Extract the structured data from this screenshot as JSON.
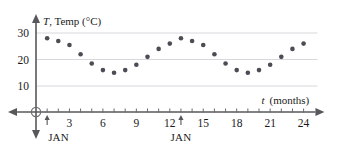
{
  "chart_data": {
    "type": "scatter",
    "title": "",
    "ylabel": "T, Temp (°C)",
    "ylabel_var": "T",
    "ylabel_rest": ", Temp (°C)",
    "xlabel": "t (months)",
    "xlabel_var": "t",
    "xlabel_rest": "(months)",
    "xlim": [
      0,
      25.6
    ],
    "ylim": [
      0,
      32
    ],
    "grid": true,
    "gridlines_y": [
      10,
      20,
      30
    ],
    "yticks": [
      10,
      20,
      30
    ],
    "ytick_labels": [
      "10",
      "20",
      "30"
    ],
    "xticks": [
      1,
      2,
      3,
      4,
      5,
      6,
      7,
      8,
      9,
      10,
      11,
      12,
      13,
      14,
      15,
      16,
      17,
      18,
      19,
      20,
      21,
      22,
      23,
      24
    ],
    "xtick_labels_shown": [
      {
        "t": 3,
        "label": "3"
      },
      {
        "t": 6,
        "label": "6"
      },
      {
        "t": 9,
        "label": "9"
      },
      {
        "t": 12,
        "label": "12"
      },
      {
        "t": 15,
        "label": "15"
      },
      {
        "t": 18,
        "label": "18"
      },
      {
        "t": 21,
        "label": "21"
      },
      {
        "t": 24,
        "label": "24"
      }
    ],
    "annotations": [
      {
        "name": "jan-marker-year1",
        "t": 1,
        "label": "JAN"
      },
      {
        "name": "jan-marker-year2",
        "t": 13,
        "label": "JAN"
      }
    ],
    "origin_marker": true,
    "legend": null,
    "x": [
      1,
      2,
      3,
      4,
      5,
      6,
      7,
      8,
      9,
      10,
      11,
      12,
      13,
      14,
      15,
      16,
      17,
      18,
      19,
      20,
      21,
      22,
      23,
      24
    ],
    "values": [
      28,
      27,
      25.5,
      22,
      18.5,
      16,
      15,
      16,
      18,
      21,
      24,
      26,
      28,
      27,
      25.5,
      22,
      18.5,
      16,
      15,
      16,
      18,
      21,
      24,
      26
    ],
    "series": [
      {
        "name": "Monthly average temperature",
        "values": [
          28,
          27,
          25.5,
          22,
          18.5,
          16,
          15,
          16,
          18,
          21,
          24,
          26,
          28,
          27,
          25.5,
          22,
          18.5,
          16,
          15,
          16,
          18,
          21,
          24,
          26
        ]
      }
    ]
  },
  "colors": {
    "point": "#4c4c54",
    "axis": "#58585c",
    "grid": "#d8d8dc",
    "text": "#1a1a1a",
    "background": "#ffffff"
  }
}
